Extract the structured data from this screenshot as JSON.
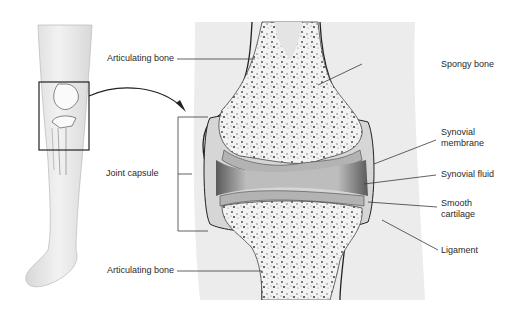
{
  "diagram": {
    "labels": {
      "articulating_bone_top": "Articulating bone",
      "joint_capsule": "Joint capsule",
      "articulating_bone_bottom": "Articulating bone",
      "spongy_bone": "Spongy bone",
      "synovial_membrane_1": "Synovial",
      "synovial_membrane_2": "membrane",
      "synovial_fluid": "Synovial fluid",
      "smooth_cartilage_1": "Smooth",
      "smooth_cartilage_2": "cartilage",
      "ligament": "Ligament"
    },
    "colors": {
      "line": "#2b2b2b",
      "skin": "#e6e6e6",
      "bone": "#f4f4f4",
      "cartilage": "#b8b8b8",
      "fluid": "#9a9a9a",
      "speckle": "#555555"
    }
  }
}
